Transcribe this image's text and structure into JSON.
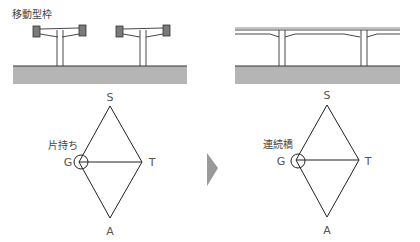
{
  "left_panel": {
    "caption": "移動型枠",
    "diagram_label": "片持ち",
    "nodes": {
      "top": "S",
      "left": "G",
      "right": "T",
      "bottom": "A"
    }
  },
  "right_panel": {
    "diagram_label": "連続橋",
    "nodes": {
      "top": "S",
      "left": "G",
      "right": "T",
      "bottom": "A"
    }
  },
  "arrow": {
    "icon": "triangle-right-arrow",
    "color": "#999999"
  },
  "colors": {
    "ground": "#b5b5b5",
    "line": "#333333",
    "form_block": "#7a7a7a"
  }
}
